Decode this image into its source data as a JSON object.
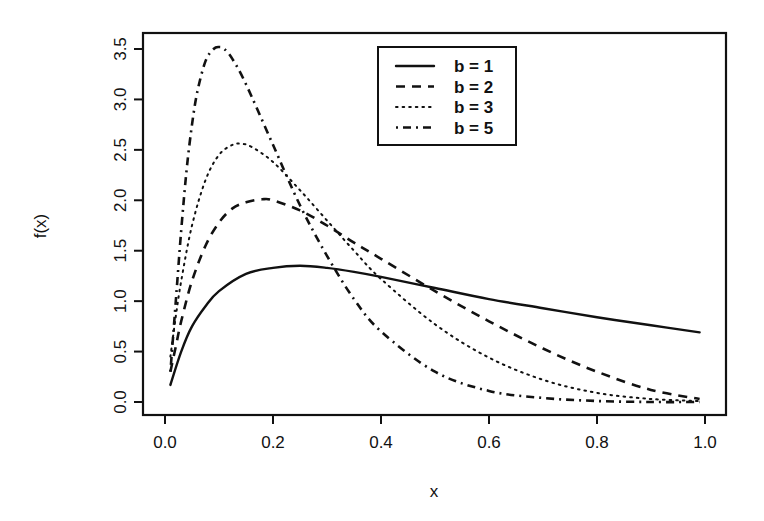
{
  "chart_data": {
    "type": "line",
    "title": "",
    "xlabel": "x",
    "ylabel": "f(x)",
    "xlim": [
      -0.04,
      1.04
    ],
    "ylim": [
      -0.12,
      3.68
    ],
    "xticks": [
      0.0,
      0.2,
      0.4,
      0.6,
      0.8,
      1.0
    ],
    "xtick_labels": [
      "0.0",
      "0.2",
      "0.4",
      "0.6",
      "0.8",
      "1.0"
    ],
    "yticks": [
      0.0,
      0.5,
      1.0,
      1.5,
      2.0,
      2.5,
      3.0,
      3.5
    ],
    "ytick_labels": [
      "0.0",
      "0.5",
      "1.0",
      "1.5",
      "2.0",
      "2.5",
      "3.0",
      "3.5"
    ],
    "grid": false,
    "legend_position": "top-center-right",
    "series": [
      {
        "name": "b = 1",
        "style": "solid",
        "x": [
          0.01,
          0.03,
          0.05,
          0.075,
          0.1,
          0.15,
          0.2,
          0.25,
          0.3,
          0.35,
          0.4,
          0.5,
          0.6,
          0.7,
          0.8,
          0.9,
          0.99
        ],
        "y": [
          0.17,
          0.5,
          0.75,
          0.95,
          1.1,
          1.27,
          1.33,
          1.35,
          1.33,
          1.29,
          1.24,
          1.13,
          1.02,
          0.93,
          0.84,
          0.76,
          0.69
        ]
      },
      {
        "name": "b = 2",
        "style": "dashed",
        "x": [
          0.01,
          0.02,
          0.03,
          0.05,
          0.075,
          0.1,
          0.125,
          0.15,
          0.18,
          0.2,
          0.25,
          0.3,
          0.35,
          0.4,
          0.5,
          0.6,
          0.7,
          0.8,
          0.9,
          0.99
        ],
        "y": [
          0.3,
          0.55,
          0.8,
          1.2,
          1.55,
          1.78,
          1.92,
          1.98,
          2.01,
          2.0,
          1.9,
          1.75,
          1.58,
          1.42,
          1.1,
          0.8,
          0.53,
          0.3,
          0.12,
          0.03
        ]
      },
      {
        "name": "b = 3",
        "style": "dotted",
        "x": [
          0.01,
          0.02,
          0.03,
          0.05,
          0.075,
          0.1,
          0.125,
          0.14,
          0.16,
          0.2,
          0.25,
          0.3,
          0.35,
          0.4,
          0.5,
          0.6,
          0.7,
          0.8,
          0.9,
          0.99
        ],
        "y": [
          0.45,
          0.85,
          1.2,
          1.75,
          2.2,
          2.45,
          2.55,
          2.56,
          2.53,
          2.38,
          2.1,
          1.8,
          1.5,
          1.22,
          0.77,
          0.44,
          0.22,
          0.09,
          0.03,
          0.01
        ]
      },
      {
        "name": "b = 5",
        "style": "dotdash",
        "x": [
          0.01,
          0.02,
          0.03,
          0.04,
          0.05,
          0.06,
          0.075,
          0.09,
          0.1,
          0.11,
          0.125,
          0.15,
          0.2,
          0.25,
          0.3,
          0.35,
          0.4,
          0.5,
          0.6,
          0.7,
          0.8,
          0.9,
          0.99
        ],
        "y": [
          0.3,
          1.0,
          1.7,
          2.3,
          2.75,
          3.08,
          3.38,
          3.5,
          3.52,
          3.5,
          3.4,
          3.15,
          2.55,
          1.95,
          1.45,
          1.02,
          0.7,
          0.3,
          0.11,
          0.04,
          0.01,
          0.0,
          0.0
        ]
      }
    ]
  },
  "plot_box": {
    "left": 143,
    "right": 726,
    "top": 33,
    "bottom": 415
  },
  "legend": {
    "box": {
      "left": 378,
      "top": 47,
      "width": 138,
      "height": 98
    },
    "entries": [
      {
        "label": "b = 1",
        "style": "solid"
      },
      {
        "label": "b = 2",
        "style": "dashed"
      },
      {
        "label": "b = 3",
        "style": "dotted"
      },
      {
        "label": "b = 5",
        "style": "dotdash"
      }
    ]
  },
  "colors": {
    "ink": "#111111",
    "background": "#ffffff"
  }
}
